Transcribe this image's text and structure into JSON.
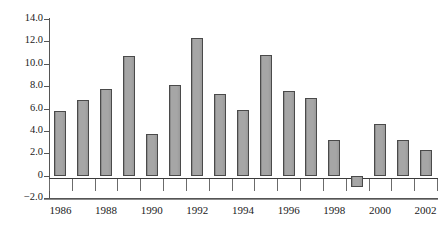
{
  "chart_data": {
    "type": "bar",
    "title": "",
    "subtitle": "",
    "xlabel": "",
    "ylabel": "",
    "categories": [
      1986,
      1987,
      1988,
      1989,
      1990,
      1991,
      1992,
      1993,
      1994,
      1995,
      1996,
      1997,
      1998,
      1999,
      2000,
      2001,
      2002
    ],
    "values": [
      5.8,
      6.8,
      7.7,
      10.7,
      3.7,
      8.1,
      12.3,
      7.3,
      5.9,
      10.8,
      7.6,
      6.9,
      3.2,
      -1.0,
      4.6,
      3.2,
      2.3
    ],
    "ylim": [
      -2.0,
      14.0
    ],
    "ytick_values": [
      14.0,
      12.0,
      10.0,
      8.0,
      6.0,
      4.0,
      2.0,
      0,
      -2.0
    ],
    "ytick_labels": [
      "14.0",
      "12.0",
      "10.0",
      "8.0",
      "6.0",
      "4.0",
      "2.0",
      "0",
      "−2.0"
    ],
    "xtick_labels": [
      "1986",
      "1988",
      "1990",
      "1992",
      "1994",
      "1996",
      "1998",
      "2000",
      "2002"
    ],
    "xtick_values": [
      1986,
      1988,
      1990,
      1992,
      1994,
      1996,
      1998,
      2000,
      2002
    ],
    "grid": false,
    "legend": null,
    "bar_color": "#9e9e9e",
    "bar_edge_color": "#4a4a4a",
    "axis_color": "#555555",
    "background_color": "#ffffff"
  }
}
